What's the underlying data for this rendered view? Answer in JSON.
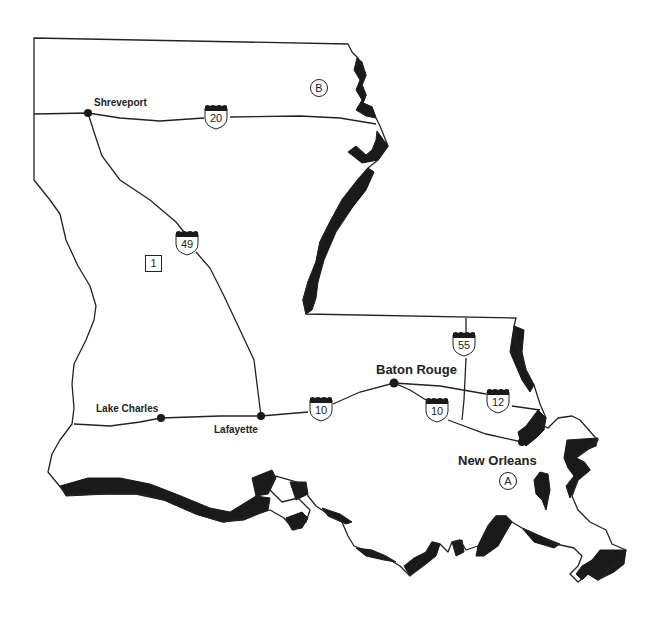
{
  "map": {
    "subject": "Louisiana",
    "colors": {
      "outline": "#222222",
      "water_fill": "#1a1a1a",
      "background": "#ffffff"
    },
    "cities": [
      {
        "name": "Shreveport",
        "x": 88,
        "y": 113
      },
      {
        "name": "Lake Charles",
        "x": 161,
        "y": 418
      },
      {
        "name": "Lafayette",
        "x": 261,
        "y": 416
      },
      {
        "name": "Baton Rouge",
        "x": 394,
        "y": 383
      },
      {
        "name": "New Orleans",
        "x": 522,
        "y": 442
      }
    ],
    "interstates": [
      {
        "number": "20",
        "x": 216,
        "y": 118
      },
      {
        "number": "49",
        "x": 187,
        "y": 244
      },
      {
        "number": "55",
        "x": 464,
        "y": 343
      },
      {
        "number": "10",
        "x": 320,
        "y": 409
      },
      {
        "number": "10",
        "x": 436,
        "y": 410
      },
      {
        "number": "12",
        "x": 498,
        "y": 401
      }
    ],
    "markers": [
      {
        "label": "B",
        "shape": "circle",
        "x": 319,
        "y": 88
      },
      {
        "label": "A",
        "shape": "circle",
        "x": 508,
        "y": 481
      },
      {
        "label": "1",
        "shape": "square",
        "x": 153,
        "y": 263
      }
    ]
  }
}
